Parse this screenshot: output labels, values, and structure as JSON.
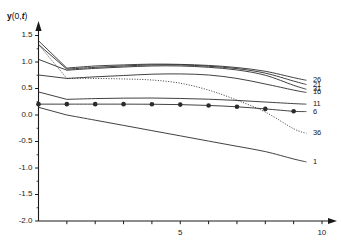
{
  "chart_data": {
    "type": "line",
    "title": "",
    "subtitle": "",
    "xlabel": "",
    "ylabel": "y(0,t)",
    "ylabel_parts": {
      "symbol": "y",
      "paren_open": "(0,",
      "var": "t",
      "paren_close": ")"
    },
    "xlim": [
      0,
      10
    ],
    "ylim": [
      -2.0,
      1.6
    ],
    "grid": false,
    "legend_position": "right-end-of-curve-labels",
    "y_ticks": [
      -2.0,
      -1.5,
      -1.0,
      -0.5,
      0.0,
      0.5,
      1.0,
      1.5
    ],
    "y_ticklabels": [
      "-2.0",
      "-1.5",
      "-1.0",
      "-0.5",
      "0.0",
      "0.5",
      "1.0",
      "1.5"
    ],
    "y_minor_ticks": [
      -1.75,
      -1.25,
      -0.75,
      -0.25,
      0.25,
      0.75,
      1.25
    ],
    "x_ticks": [
      0,
      1,
      2,
      3,
      4,
      5,
      6,
      7,
      8,
      9,
      10
    ],
    "x_ticklabels": [
      "",
      "",
      "",
      "",
      "",
      "5",
      "",
      "",
      "",
      "",
      "10"
    ],
    "x_labeled_ticks": [
      {
        "value": 5,
        "label": "5"
      },
      {
        "value": 10,
        "label": "10"
      }
    ],
    "axis_arrows": true,
    "series": [
      {
        "name": "26",
        "label": "26",
        "style": "solid",
        "marker": "none",
        "label_y": 0.655,
        "x": [
          0.0,
          1.0,
          2.0,
          3.0,
          4.0,
          5.0,
          6.0,
          7.0,
          8.0,
          9.0,
          9.45
        ],
        "values": [
          1.4,
          0.885,
          0.925,
          0.945,
          0.96,
          0.955,
          0.935,
          0.895,
          0.825,
          0.705,
          0.655
        ]
      },
      {
        "name": "21",
        "label": "21",
        "style": "solid",
        "marker": "none",
        "label_y": 0.575,
        "x": [
          0.0,
          1.0,
          2.0,
          3.0,
          4.0,
          5.0,
          6.0,
          7.0,
          8.0,
          9.0,
          9.45
        ],
        "values": [
          1.33,
          0.865,
          0.9,
          0.925,
          0.945,
          0.945,
          0.92,
          0.875,
          0.79,
          0.64,
          0.575
        ]
      },
      {
        "name": "31",
        "label": "31",
        "style": "solid",
        "marker": "none",
        "label_y": 0.485,
        "x": [
          0.0,
          1.0,
          2.0,
          3.0,
          4.0,
          5.0,
          6.0,
          7.0,
          8.0,
          9.0,
          9.45
        ],
        "values": [
          1.05,
          0.845,
          0.88,
          0.905,
          0.925,
          0.925,
          0.9,
          0.85,
          0.75,
          0.56,
          0.485
        ]
      },
      {
        "name": "16",
        "label": "16",
        "style": "solid",
        "marker": "none",
        "label_y": 0.425,
        "x": [
          0.0,
          1.0,
          2.0,
          3.0,
          4.0,
          5.0,
          6.0,
          7.0,
          8.0,
          9.0,
          9.45
        ],
        "values": [
          0.755,
          0.69,
          0.72,
          0.745,
          0.77,
          0.775,
          0.755,
          0.69,
          0.585,
          0.47,
          0.425
        ]
      },
      {
        "name": "11",
        "label": "11",
        "style": "solid",
        "marker": "none",
        "label_y": 0.205,
        "x": [
          0.0,
          1.0,
          2.0,
          3.0,
          4.0,
          5.0,
          6.0,
          7.0,
          8.0,
          9.0,
          9.45
        ],
        "values": [
          0.435,
          0.295,
          0.31,
          0.318,
          0.32,
          0.312,
          0.298,
          0.275,
          0.245,
          0.215,
          0.205
        ]
      },
      {
        "name": "6",
        "label": "6",
        "style": "solid",
        "marker": "filled-circle",
        "label_y": 0.065,
        "x": [
          0.0,
          1.0,
          2.0,
          3.0,
          4.0,
          5.0,
          6.0,
          7.0,
          8.0,
          9.0,
          9.45
        ],
        "values": [
          0.205,
          0.205,
          0.205,
          0.205,
          0.203,
          0.196,
          0.18,
          0.155,
          0.115,
          0.07,
          0.065
        ],
        "marker_x": [
          0.0,
          1.0,
          2.0,
          3.0,
          4.0,
          5.0,
          6.0,
          7.0,
          8.0,
          9.0
        ],
        "marker_y": [
          0.205,
          0.205,
          0.205,
          0.205,
          0.203,
          0.196,
          0.18,
          0.155,
          0.115,
          0.07
        ]
      },
      {
        "name": "36",
        "label": "36",
        "style": "dotted",
        "marker": "none",
        "label_y": -0.345,
        "x": [
          0.0,
          1.0,
          2.0,
          3.0,
          4.0,
          5.0,
          6.0,
          7.0,
          8.0,
          9.0,
          9.45
        ],
        "values": [
          1.33,
          0.69,
          0.69,
          0.68,
          0.66,
          0.6,
          0.47,
          0.28,
          0.055,
          -0.26,
          -0.345
        ]
      },
      {
        "name": "1",
        "label": "1",
        "style": "solid",
        "marker": "none",
        "label_y": -0.885,
        "x": [
          0.0,
          1.0,
          2.0,
          3.0,
          4.0,
          5.0,
          6.0,
          7.0,
          8.0,
          9.0,
          9.45
        ],
        "values": [
          0.145,
          0.0,
          -0.098,
          -0.196,
          -0.295,
          -0.393,
          -0.492,
          -0.59,
          -0.69,
          -0.83,
          -0.885
        ]
      }
    ]
  },
  "colors": {
    "axis": "#1a1a1a",
    "curve": "#2b2b2b",
    "text": "#1a1a1a",
    "background": "#ffffff"
  }
}
